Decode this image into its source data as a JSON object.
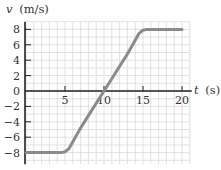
{
  "chart_data": {
    "type": "line",
    "title": "",
    "xlabel": "t (s)",
    "ylabel": "v (m/s)",
    "xlabel_var": "t",
    "xlabel_unit": "(s)",
    "ylabel_var": "v",
    "ylabel_unit": "(m/s)",
    "xlim": [
      0,
      21
    ],
    "ylim": [
      -9.5,
      9
    ],
    "x_ticks": [
      5,
      10,
      15,
      20
    ],
    "y_ticks": [
      8,
      6,
      4,
      2,
      0,
      -2,
      -4,
      -6,
      -8
    ],
    "y_tick_labels": [
      "8",
      "6",
      "4",
      "2",
      "0",
      "−2",
      "−4",
      "−6",
      "−8"
    ],
    "grid": true,
    "grid_minor_step_x": 1,
    "grid_minor_step_y": 1,
    "series": [
      {
        "name": "v(t)",
        "color": "#8a8a8a",
        "points": [
          [
            0,
            -8
          ],
          [
            4.5,
            -8
          ],
          [
            5,
            -7.9
          ],
          [
            5.5,
            -7.5
          ],
          [
            6,
            -6.6
          ],
          [
            7,
            -4.8
          ],
          [
            8,
            -3.2
          ],
          [
            9,
            -1.6
          ],
          [
            10,
            0
          ],
          [
            11,
            1.6
          ],
          [
            12,
            3.2
          ],
          [
            13,
            4.8
          ],
          [
            14,
            6.6
          ],
          [
            14.5,
            7.5
          ],
          [
            15,
            7.9
          ],
          [
            15.5,
            8
          ],
          [
            20,
            8
          ]
        ]
      }
    ],
    "legend": null
  },
  "colors": {
    "grid": "#d9d9d9",
    "axis": "#222222",
    "curve": "#8a8a8a",
    "text": "#333333"
  }
}
